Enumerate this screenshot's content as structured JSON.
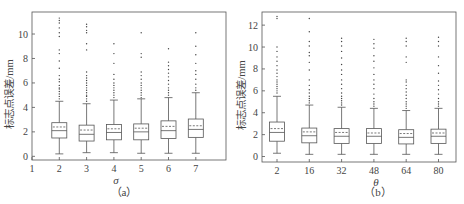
{
  "chart_data": [
    {
      "type": "boxplot",
      "panel_label": "（a）",
      "xlabel": "σ",
      "ylabel": "标志点误差/mm",
      "x_ticks": [
        "1",
        "2",
        "3",
        "4",
        "5",
        "6",
        "7"
      ],
      "categories": [
        "2",
        "3",
        "4",
        "5",
        "6",
        "7"
      ],
      "ylim": [
        -0.3,
        11.8
      ],
      "y_ticks": [
        0,
        2,
        4,
        6,
        8,
        10
      ],
      "grid": false,
      "boxes": [
        {
          "x": "2",
          "whisker_low": 0.2,
          "q1": 1.5,
          "median": 2.1,
          "mean": 2.4,
          "q3": 2.75,
          "whisker_high": 4.5,
          "outliers": [
            4.7,
            4.9,
            5.1,
            5.3,
            5.5,
            5.6,
            5.8,
            6.1,
            6.3,
            6.6,
            7.2,
            7.8,
            8.4,
            8.7,
            9.8,
            10.1,
            10.5,
            10.9,
            11.1,
            11.3
          ]
        },
        {
          "x": "3",
          "whisker_low": 0.3,
          "q1": 1.25,
          "median": 1.8,
          "mean": 2.15,
          "q3": 2.55,
          "whisker_high": 4.3,
          "outliers": [
            4.5,
            4.7,
            4.9,
            5.0,
            5.2,
            5.4,
            5.6,
            5.8,
            6.0,
            6.2,
            6.4,
            6.6,
            6.9,
            8.7,
            9.2,
            10.1,
            10.3,
            10.6,
            10.8
          ]
        },
        {
          "x": "4",
          "whisker_low": 0.3,
          "q1": 1.35,
          "median": 1.95,
          "mean": 2.25,
          "q3": 2.6,
          "whisker_high": 4.6,
          "outliers": [
            4.8,
            5.0,
            5.2,
            5.4,
            5.6,
            5.8,
            6.0,
            6.3,
            6.7,
            7.6,
            8.4,
            9.2
          ]
        },
        {
          "x": "5",
          "whisker_low": 0.25,
          "q1": 1.35,
          "median": 2.0,
          "mean": 2.3,
          "q3": 2.65,
          "whisker_high": 4.7,
          "outliers": [
            4.8,
            5.0,
            5.2,
            5.4,
            5.6,
            5.8,
            6.0,
            6.3,
            6.6,
            6.9,
            8.1,
            8.4,
            10.1
          ]
        },
        {
          "x": "6",
          "whisker_low": 0.25,
          "q1": 1.45,
          "median": 2.1,
          "mean": 2.45,
          "q3": 2.9,
          "whisker_high": 4.8,
          "outliers": [
            5.0,
            5.2,
            5.4,
            5.6,
            5.9,
            6.2,
            6.5,
            6.8,
            7.1,
            7.4,
            7.7,
            8.8
          ]
        },
        {
          "x": "7",
          "whisker_low": 0.25,
          "q1": 1.55,
          "median": 2.2,
          "mean": 2.5,
          "q3": 3.05,
          "whisker_high": 5.2,
          "outliers": [
            5.4,
            5.6,
            5.9,
            6.3,
            6.7,
            7.0,
            7.6,
            8.3,
            9.0,
            10.1
          ]
        }
      ]
    },
    {
      "type": "boxplot",
      "panel_label": "（b）",
      "xlabel": "θ",
      "ylabel": "标志点误差/mm",
      "categories": [
        "2",
        "16",
        "32",
        "48",
        "64",
        "80"
      ],
      "x_ticks": [
        "2",
        "16",
        "32",
        "48",
        "64",
        "80"
      ],
      "ylim": [
        -0.5,
        13.2
      ],
      "y_ticks": [
        0,
        2,
        4,
        6,
        8,
        10,
        12
      ],
      "grid": false,
      "boxes": [
        {
          "x": "2",
          "whisker_low": 0.3,
          "q1": 1.4,
          "median": 2.2,
          "mean": 2.55,
          "q3": 3.15,
          "whisker_high": 5.5,
          "outliers": [
            5.8,
            6.0,
            6.2,
            6.4,
            6.6,
            6.8,
            7.0,
            7.3,
            7.6,
            7.9,
            8.3,
            8.7,
            9.1,
            9.6,
            10.0,
            12.6,
            12.8
          ]
        },
        {
          "x": "16",
          "whisker_low": 0.2,
          "q1": 1.25,
          "median": 1.9,
          "mean": 2.25,
          "q3": 2.6,
          "whisker_high": 4.7,
          "outliers": [
            4.9,
            5.1,
            5.3,
            5.5,
            5.8,
            6.1,
            6.5,
            7.0,
            7.9,
            8.6,
            9.2,
            9.5,
            10.1,
            10.5,
            11.4,
            12.6
          ]
        },
        {
          "x": "32",
          "whisker_low": 0.2,
          "q1": 1.2,
          "median": 1.85,
          "mean": 2.2,
          "q3": 2.55,
          "whisker_high": 4.5,
          "outliers": [
            4.7,
            4.9,
            5.1,
            5.3,
            5.5,
            5.8,
            6.2,
            6.6,
            7.0,
            7.5,
            7.9,
            8.4,
            9.0,
            9.6,
            10.1,
            10.5,
            10.8
          ]
        },
        {
          "x": "48",
          "whisker_low": 0.2,
          "q1": 1.2,
          "median": 1.85,
          "mean": 2.15,
          "q3": 2.55,
          "whisker_high": 4.4,
          "outliers": [
            4.6,
            4.8,
            5.0,
            5.3,
            5.7,
            6.2,
            6.6,
            7.0,
            7.5,
            8.1,
            8.7,
            9.2,
            9.9,
            10.3,
            10.7
          ]
        },
        {
          "x": "64",
          "whisker_low": 0.2,
          "q1": 1.15,
          "median": 1.75,
          "mean": 2.1,
          "q3": 2.45,
          "whisker_high": 4.2,
          "outliers": [
            4.4,
            4.6,
            4.8,
            5.0,
            5.3,
            5.6,
            5.9,
            6.2,
            6.5,
            6.8,
            7.0,
            8.6,
            9.1,
            10.1,
            10.5,
            10.8
          ]
        },
        {
          "x": "80",
          "whisker_low": 0.2,
          "q1": 1.2,
          "median": 1.85,
          "mean": 2.15,
          "q3": 2.5,
          "whisker_high": 4.4,
          "outliers": [
            4.6,
            4.8,
            5.0,
            5.3,
            5.7,
            6.1,
            6.5,
            6.9,
            7.6,
            8.3,
            9.1,
            10.1,
            10.5,
            10.9
          ]
        }
      ]
    }
  ]
}
